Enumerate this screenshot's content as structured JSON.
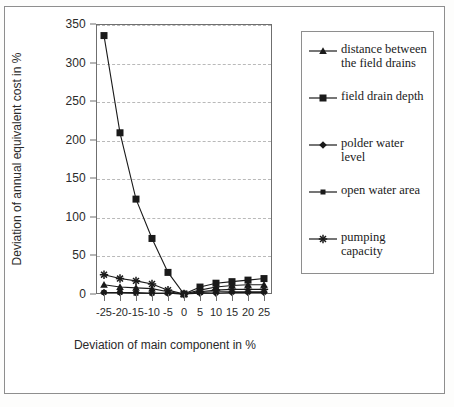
{
  "chart_data": {
    "type": "line",
    "title": "",
    "xlabel": "Deviation of main component in %",
    "ylabel": "Deviation of annual equivalent cost in %",
    "x": [
      -25,
      -20,
      -15,
      -10,
      -5,
      0,
      5,
      10,
      15,
      20,
      25
    ],
    "xlim": [
      -27.5,
      27.5
    ],
    "ylim": [
      0,
      350
    ],
    "xticks": [
      "-25",
      "-20",
      "-15",
      "-10",
      "-5",
      "0",
      "5",
      "10",
      "15",
      "20",
      "25"
    ],
    "yticks": [
      "0",
      "50",
      "100",
      "150",
      "200",
      "250",
      "300",
      "350"
    ],
    "grid": "horizontal-dashed",
    "legend_position": "right",
    "series": [
      {
        "name": "distance between the field drains",
        "marker": "triangle",
        "color": "#1a1a1a",
        "values": [
          12,
          9,
          8,
          7,
          3,
          0,
          5,
          9,
          11,
          12,
          12
        ]
      },
      {
        "name": "field drain depth",
        "marker": "square-large",
        "color": "#1a1a1a",
        "values": [
          335,
          209,
          123,
          72,
          28,
          0,
          9,
          14,
          16,
          18,
          20
        ]
      },
      {
        "name": "polder water level",
        "marker": "diamond",
        "color": "#1a1a1a",
        "values": [
          2,
          2,
          2,
          1,
          1,
          0,
          1,
          1,
          2,
          2,
          2
        ]
      },
      {
        "name": "open water area",
        "marker": "square-small",
        "color": "#1a1a1a",
        "values": [
          2,
          2,
          1,
          1,
          1,
          0,
          2,
          3,
          3,
          3,
          3
        ]
      },
      {
        "name": "pumping capacity",
        "marker": "asterisk",
        "color": "#1a1a1a",
        "values": [
          25,
          20,
          17,
          13,
          5,
          0,
          3,
          5,
          6,
          6,
          6
        ]
      }
    ]
  },
  "legend": {
    "entries": [
      {
        "label": "distance between the field drains",
        "marker": "triangle"
      },
      {
        "label": "field drain depth",
        "marker": "square-large"
      },
      {
        "label": "polder water level",
        "marker": "diamond"
      },
      {
        "label": "open water area",
        "marker": "square-small"
      },
      {
        "label": "pumping capacity",
        "marker": "asterisk"
      }
    ]
  }
}
